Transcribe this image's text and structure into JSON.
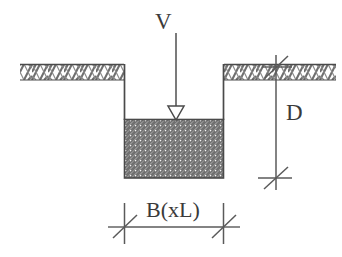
{
  "figure": {
    "kind": "engineering-section-diagram",
    "background_color": "#ffffff",
    "line_color": "#4a4a4a",
    "hatch_color": "#6e6e6e",
    "text_color": "#3a3a3a"
  },
  "labels": {
    "load": "V",
    "depth": "D",
    "width": "B(xL)"
  },
  "annotations": {
    "load_arrow": {
      "name": "vertical-load-arrow",
      "direction": "down",
      "arrowhead": "open-triangle",
      "x": 176,
      "y_start": 33,
      "y_end": 119
    },
    "depth_dimension": {
      "name": "depth-dimension-D",
      "orientation": "vertical",
      "x": 276,
      "y_start": 55,
      "y_end": 190,
      "tick_style": "slash",
      "tick_top_y": 68,
      "tick_bottom_y": 178
    },
    "width_dimension": {
      "name": "width-dimension-B",
      "orientation": "horizontal",
      "y": 227,
      "x_start": 124,
      "x_end": 224,
      "tick_style": "slash",
      "extension_lines": true
    }
  },
  "geometry": {
    "ground_left": {
      "x": 20,
      "y": 64,
      "width": 104,
      "hatch_depth": 16,
      "hatch": "chevron"
    },
    "ground_right": {
      "x": 224,
      "y": 64,
      "width": 112,
      "hatch_depth": 16,
      "hatch": "chevron"
    },
    "excavation": {
      "left_wall_x": 124,
      "right_wall_x": 224,
      "top_y": 64,
      "bottom_y": 119
    },
    "footing_block": {
      "x": 124,
      "y": 119,
      "width": 100,
      "height": 59,
      "hatch": "diagonal-45"
    }
  }
}
